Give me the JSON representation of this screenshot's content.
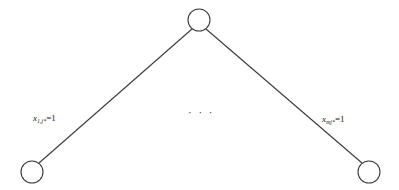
{
  "diagram": {
    "type": "tree",
    "nodes": [
      {
        "id": "root",
        "cx": 199,
        "cy": 20,
        "r": 11
      },
      {
        "id": "leaf-1",
        "cx": 32,
        "cy": 172,
        "r": 11
      },
      {
        "id": "leaf-m",
        "cx": 369,
        "cy": 172,
        "r": 11
      }
    ],
    "edges": [
      {
        "from": "root",
        "to": "leaf-1",
        "label_var": "x",
        "label_sub": "1,j*",
        "label_rhs": "=1"
      },
      {
        "from": "root",
        "to": "leaf-m",
        "label_var": "x",
        "label_sub": "mj*",
        "label_rhs": "=1"
      }
    ],
    "ellipsis": "· · ·",
    "colors": {
      "stroke": "#3a3a3a",
      "background": "#ffffff"
    }
  }
}
